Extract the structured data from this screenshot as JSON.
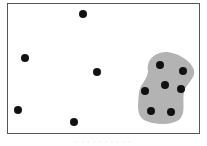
{
  "diagram": {
    "type": "cluster-illustration",
    "frame": {
      "x": 7,
      "y": 3,
      "width": 193,
      "height": 131,
      "stroke": "#555555"
    },
    "cluster_region": {
      "fill": "#b3b3b3",
      "path": "M148,72 C146,62 152,53 165,52 C178,52 192,62 194,70 C196,78 186,84 184,92 C182,102 186,112 180,119 C172,126 154,125 144,120 C136,115 138,104 139,93 C140,84 146,82 148,72 Z"
    },
    "points": {
      "color": "#111111",
      "radius": 4,
      "outliers": [
        {
          "x": 83,
          "y": 14
        },
        {
          "x": 25,
          "y": 58
        },
        {
          "x": 97,
          "y": 72
        },
        {
          "x": 18,
          "y": 110
        },
        {
          "x": 74,
          "y": 122
        }
      ],
      "clustered": [
        {
          "x": 160,
          "y": 65
        },
        {
          "x": 183,
          "y": 71
        },
        {
          "x": 145,
          "y": 91
        },
        {
          "x": 165,
          "y": 85
        },
        {
          "x": 181,
          "y": 89
        },
        {
          "x": 151,
          "y": 111
        },
        {
          "x": 171,
          "y": 112
        }
      ]
    },
    "caption": "· · · · · · · · · ·"
  }
}
